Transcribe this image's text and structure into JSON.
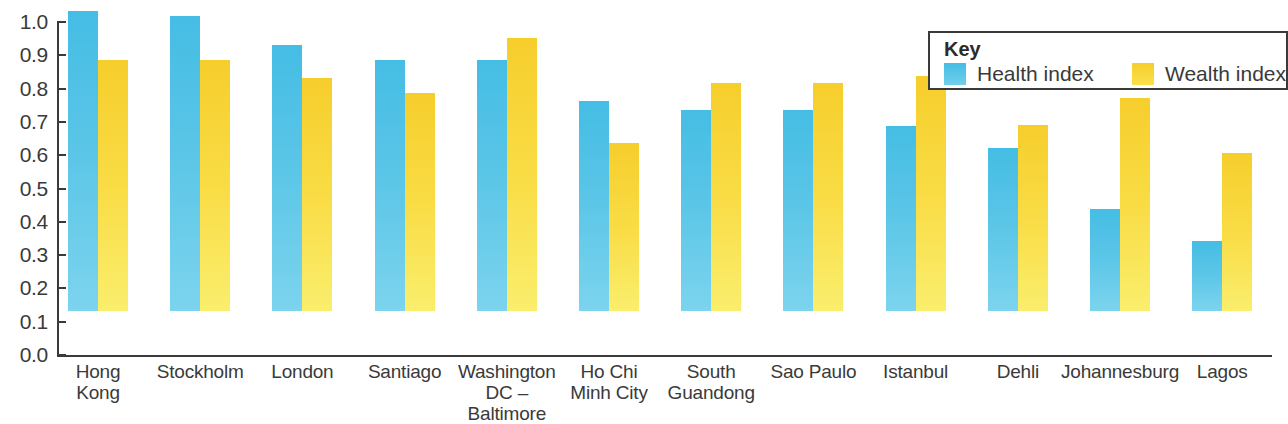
{
  "chart_data": {
    "type": "bar",
    "title": "",
    "xlabel": "",
    "ylabel": "",
    "ylim": [
      0.0,
      1.0
    ],
    "ytick_labels": [
      "1.0",
      "0.9",
      "0.8",
      "0.7",
      "0.6",
      "0.5",
      "0.4",
      "0.3",
      "0.2",
      "0.1",
      "0.0"
    ],
    "ytick_values": [
      1.0,
      0.9,
      0.8,
      0.7,
      0.6,
      0.5,
      0.4,
      0.3,
      0.2,
      0.1,
      0.0
    ],
    "grid": false,
    "legend_position": "top-right",
    "categories": [
      "Hong\nKong",
      "Stockholm",
      "London",
      "Santiago",
      "Washington\nDC – Baltimore",
      "Ho Chi\nMinh City",
      "South\nGuandong",
      "Sao Paulo",
      "Istanbul",
      "Dehli",
      "Johannesburg",
      "Lagos"
    ],
    "series": [
      {
        "name": "Health index",
        "color": "#45bde4",
        "values": [
          0.9,
          0.885,
          0.8,
          0.755,
          0.755,
          0.63,
          0.605,
          0.605,
          0.555,
          0.49,
          0.305,
          0.21
        ]
      },
      {
        "name": "Wealth index",
        "color": "#f6ce2c",
        "values": [
          0.755,
          0.755,
          0.7,
          0.655,
          0.82,
          0.505,
          0.685,
          0.685,
          0.705,
          0.56,
          0.64,
          0.475
        ]
      }
    ]
  },
  "legend": {
    "title": "Key",
    "items": [
      {
        "label": "Health index",
        "color": "#45bde4"
      },
      {
        "label": "Wealth index",
        "color": "#f6ce2c"
      }
    ]
  }
}
